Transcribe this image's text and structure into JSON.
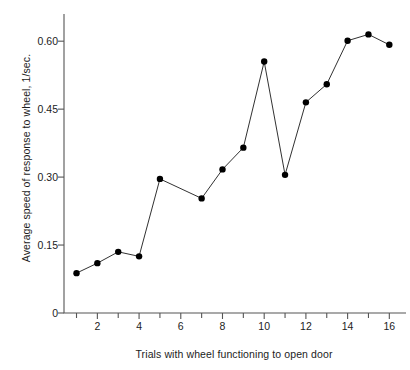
{
  "chart_data": {
    "type": "line",
    "title": "",
    "xlabel": "Trials with wheel functioning to open door",
    "ylabel": "Average speed of response to wheel, 1/sec.",
    "x": [
      1,
      2,
      3,
      4,
      5,
      6,
      7,
      8,
      9,
      10,
      11,
      12,
      13,
      14,
      15,
      16
    ],
    "values": [
      0.088,
      0.11,
      0.135,
      0.125,
      0.296,
      null,
      0.253,
      0.317,
      0.365,
      0.555,
      0.305,
      0.465,
      0.505,
      0.601,
      0.615,
      0.592
    ],
    "markers": [
      true,
      true,
      true,
      true,
      true,
      false,
      true,
      true,
      true,
      true,
      true,
      true,
      true,
      true,
      true,
      true
    ],
    "xlim": [
      0.4,
      16.8
    ],
    "ylim": [
      0,
      0.66
    ],
    "ytick_values": [
      0,
      0.15,
      0.3,
      0.45,
      0.6
    ],
    "ytick_labels": [
      "0",
      "0.15",
      "0.30",
      "0.45",
      "0.60"
    ],
    "xtick_values": [
      1,
      2,
      3,
      4,
      5,
      6,
      7,
      8,
      9,
      10,
      11,
      12,
      13,
      14,
      15,
      16
    ],
    "xtick_labels_shown": [
      {
        "value": 2,
        "label": "2"
      },
      {
        "value": 4,
        "label": "4"
      },
      {
        "value": 6,
        "label": "6"
      },
      {
        "value": 8,
        "label": "8"
      },
      {
        "value": 10,
        "label": "10"
      },
      {
        "value": 12,
        "label": "12"
      },
      {
        "value": 14,
        "label": "14"
      },
      {
        "value": 16,
        "label": "16"
      }
    ],
    "grid": false,
    "legend": null,
    "line_color": "#1a1a1a",
    "marker_color": "#000000",
    "axis_color": "#555555",
    "background": "#ffffff"
  }
}
